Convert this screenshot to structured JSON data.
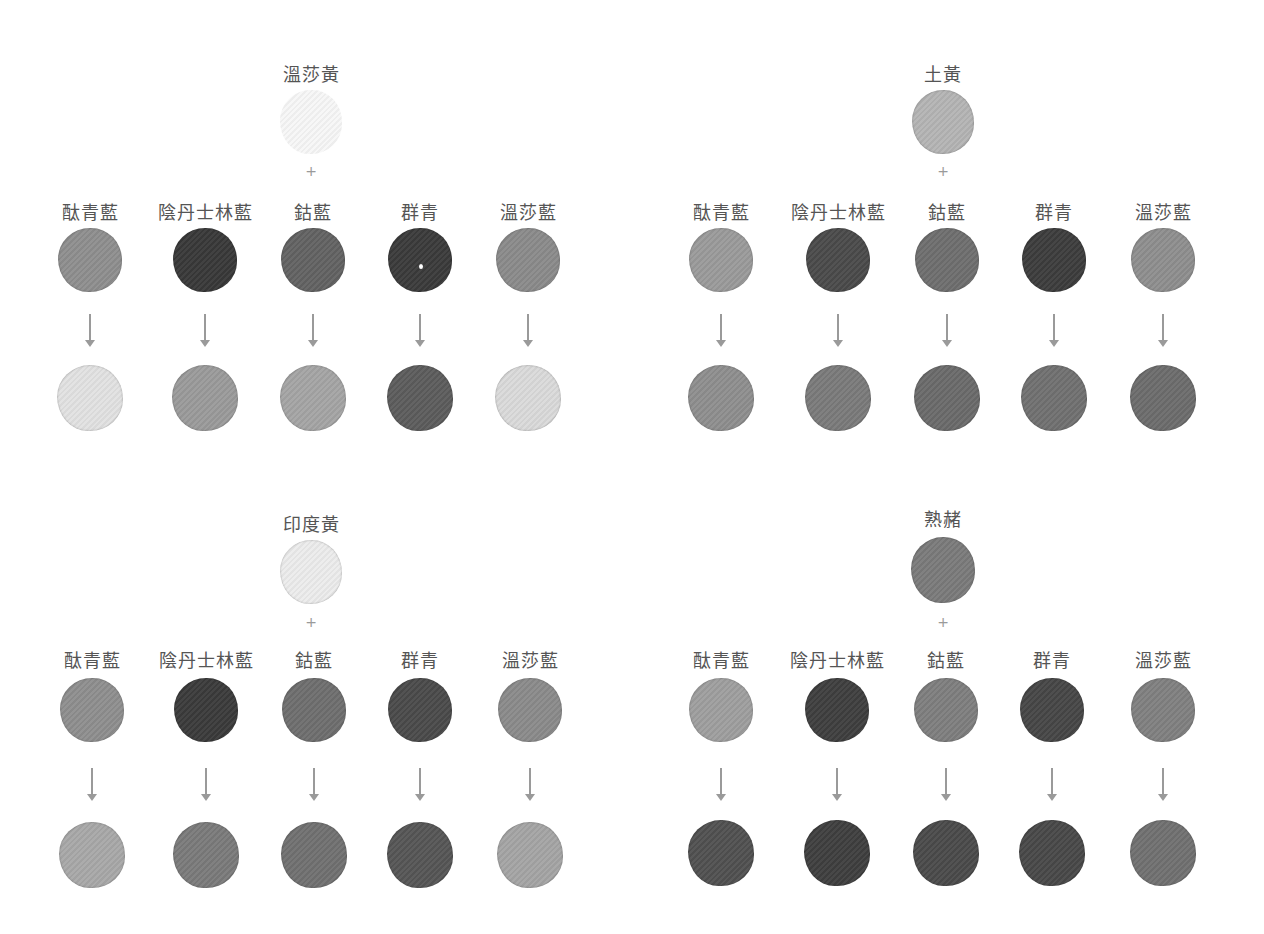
{
  "panels": [
    {
      "base": {
        "name": "溫莎黃",
        "color": "#f7f7f7"
      },
      "plus": "+",
      "mixes": [
        {
          "label": "酞青藍",
          "source_color": "#8e8e8e",
          "result_color": "#e2e2e2"
        },
        {
          "label": "陰丹士林藍",
          "source_color": "#383838",
          "result_color": "#9a9a9a"
        },
        {
          "label": "鈷藍",
          "source_color": "#626262",
          "result_color": "#a4a4a4"
        },
        {
          "label": "群青",
          "source_color": "#3a3a3a",
          "result_color": "#5c5c5c"
        },
        {
          "label": "溫莎藍",
          "source_color": "#8a8a8a",
          "result_color": "#dadada"
        }
      ]
    },
    {
      "base": {
        "name": "土黃",
        "color": "#b4b4b4"
      },
      "plus": "+",
      "mixes": [
        {
          "label": "酞青藍",
          "source_color": "#9a9a9a",
          "result_color": "#8e8e8e"
        },
        {
          "label": "陰丹士林藍",
          "source_color": "#4a4a4a",
          "result_color": "#7a7a7a"
        },
        {
          "label": "鈷藍",
          "source_color": "#6e6e6e",
          "result_color": "#6a6a6a"
        },
        {
          "label": "群青",
          "source_color": "#3c3c3c",
          "result_color": "#707070"
        },
        {
          "label": "溫莎藍",
          "source_color": "#8e8e8e",
          "result_color": "#6c6c6c"
        }
      ]
    },
    {
      "base": {
        "name": "印度黃",
        "color": "#ececec"
      },
      "plus": "+",
      "mixes": [
        {
          "label": "酞青藍",
          "source_color": "#8e8e8e",
          "result_color": "#a8a8a8"
        },
        {
          "label": "陰丹士林藍",
          "source_color": "#3a3a3a",
          "result_color": "#7a7a7a"
        },
        {
          "label": "鈷藍",
          "source_color": "#6e6e6e",
          "result_color": "#707070"
        },
        {
          "label": "群青",
          "source_color": "#4a4a4a",
          "result_color": "#555555"
        },
        {
          "label": "溫莎藍",
          "source_color": "#8a8a8a",
          "result_color": "#a4a4a4"
        }
      ]
    },
    {
      "base": {
        "name": "熟赭",
        "color": "#7a7a7a"
      },
      "plus": "+",
      "mixes": [
        {
          "label": "酞青藍",
          "source_color": "#9e9e9e",
          "result_color": "#505050"
        },
        {
          "label": "陰丹士林藍",
          "source_color": "#3e3e3e",
          "result_color": "#3e3e3e"
        },
        {
          "label": "鈷藍",
          "source_color": "#7e7e7e",
          "result_color": "#4a4a4a"
        },
        {
          "label": "群青",
          "source_color": "#464646",
          "result_color": "#484848"
        },
        {
          "label": "溫莎藍",
          "source_color": "#808080",
          "result_color": "#707070"
        }
      ]
    }
  ]
}
